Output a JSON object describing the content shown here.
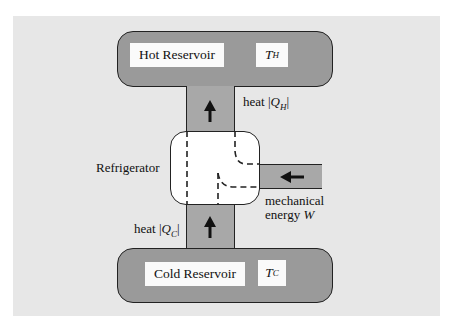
{
  "diagram": {
    "hot_reservoir": {
      "label": "Hot Reservoir",
      "temperature_symbol": "T",
      "temperature_sub": "H"
    },
    "cold_reservoir": {
      "label": "Cold Reservoir",
      "temperature_symbol": "T",
      "temperature_sub": "C"
    },
    "device": {
      "label": "Refrigerator"
    },
    "flows": {
      "heat_hot": {
        "prefix": "heat |",
        "symbol": "Q",
        "sub": "H",
        "suffix": "|",
        "direction": "up"
      },
      "heat_cold": {
        "prefix": "heat |",
        "symbol": "Q",
        "sub": "C",
        "suffix": "|",
        "direction": "up"
      },
      "work": {
        "line1": "mechanical",
        "line2_prefix": "energy ",
        "symbol": "W",
        "direction": "left"
      }
    },
    "colors": {
      "background_panel": "#e7e7e7",
      "reservoir_fill": "#9a9a9a",
      "pipe_fill": "#a8a8a8",
      "outline": "#222222",
      "device_fill": "#ffffff"
    }
  }
}
